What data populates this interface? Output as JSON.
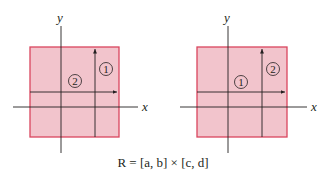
{
  "diagrams": [
    {
      "x_label": "x",
      "y_label": "y",
      "region_labels": [
        {
          "text": "1",
          "position": "right strip (vertical first)"
        },
        {
          "text": "2",
          "position": "left interior"
        }
      ]
    },
    {
      "x_label": "x",
      "y_label": "y",
      "region_labels": [
        {
          "text": "1",
          "position": "left interior"
        },
        {
          "text": "2",
          "position": "right strip"
        }
      ]
    }
  ],
  "caption": "R = [a, b] × [c, d]",
  "colors": {
    "fill": "#f2c4cc",
    "border": "#d9465e",
    "axis": "#231f20"
  }
}
